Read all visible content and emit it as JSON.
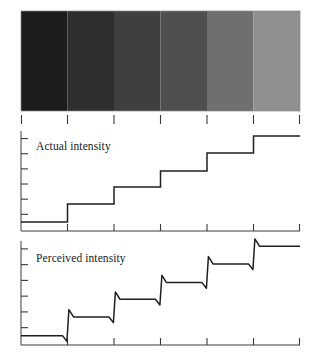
{
  "figure": {
    "background_color": "#ffffff",
    "line_color": "#1f1f1f",
    "axis_color": "#3a3a3a",
    "text_color": "#1b1b1b"
  },
  "stripe_panel": {
    "name": "grayscale-step-wedge",
    "x": 21,
    "y": 11,
    "width": 279,
    "height": 100,
    "band_count": 6,
    "band_colors": [
      "#1c1c1c",
      "#2e2e2e",
      "#3f3f3f",
      "#4f4f4f",
      "#6f6f6f",
      "#909090"
    ],
    "band_gray_values": [
      28,
      46,
      63,
      79,
      111,
      144
    ],
    "tick_positions": [
      21,
      67.5,
      114,
      160.5,
      207,
      253.5,
      300
    ],
    "tick_length": 9
  },
  "actual_panel": {
    "name": "actual-intensity-plot",
    "label": "Actual intensity",
    "label_x": 36,
    "label_y": 150,
    "axis_x": 21,
    "axis_top": 131,
    "axis_bottom": 231,
    "axis_right": 300,
    "y_tick_count": 6,
    "x_tick_positions": [
      21,
      67.5,
      114,
      160.5,
      207,
      253.5,
      300
    ],
    "step_count": 6,
    "step_levels": [
      0.09,
      0.27,
      0.44,
      0.6,
      0.78,
      0.95
    ],
    "step_edges": [
      21,
      67.5,
      114,
      160.5,
      207,
      253.5,
      300
    ]
  },
  "perceived_panel": {
    "name": "perceived-intensity-plot",
    "label": "Perceived intensity",
    "label_x": 36,
    "label_y": 262,
    "axis_x": 21,
    "axis_top": 241,
    "axis_bottom": 345,
    "axis_right": 300,
    "y_tick_count": 6,
    "x_tick_positions": [
      21,
      67.5,
      114,
      160.5,
      207,
      253.5,
      300
    ],
    "step_count": 6,
    "step_levels": [
      0.09,
      0.27,
      0.44,
      0.6,
      0.78,
      0.95
    ],
    "step_edges": [
      21,
      67.5,
      114,
      160.5,
      207,
      253.5,
      300
    ],
    "undershoot": 0.055,
    "overshoot": 0.07,
    "effect_name": "mach-bands"
  },
  "chart_data": {
    "type": "line",
    "xlabel": "",
    "ylabel": "Intensity",
    "categories": [
      "Band 1",
      "Band 2",
      "Band 3",
      "Band 4",
      "Band 5",
      "Band 6"
    ],
    "series": [
      {
        "name": "Actual intensity",
        "values": [
          0.09,
          0.27,
          0.44,
          0.6,
          0.78,
          0.95
        ],
        "shape": "staircase"
      },
      {
        "name": "Perceived intensity",
        "values": [
          0.09,
          0.27,
          0.44,
          0.6,
          0.78,
          0.95
        ],
        "shape": "staircase-with-mach-overshoot",
        "undershoot_before_edge": 0.055,
        "overshoot_after_edge": 0.07
      }
    ],
    "ylim": [
      0,
      1
    ],
    "grid": false,
    "legend": "none",
    "annotations": [
      "Actual intensity",
      "Perceived intensity"
    ]
  }
}
